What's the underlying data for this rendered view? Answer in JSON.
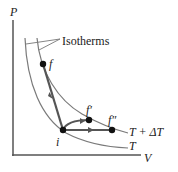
{
  "diagram": {
    "type": "PV diagram",
    "axes": {
      "y_label": "P",
      "x_label": "V"
    },
    "callout": "Isotherms",
    "isotherms": [
      {
        "label": "T + ΔT",
        "color": "#7a7a7a"
      },
      {
        "label": "T",
        "color": "#7a7a7a"
      }
    ],
    "points": [
      {
        "id": "i",
        "label": "i"
      },
      {
        "id": "f",
        "label": "f"
      },
      {
        "id": "f1",
        "label": "f′"
      },
      {
        "id": "f2",
        "label": "f″"
      }
    ],
    "paths": [
      {
        "from": "i",
        "to": "f"
      },
      {
        "from": "i",
        "to": "f′"
      },
      {
        "from": "i",
        "to": "f″"
      }
    ],
    "colors": {
      "axis": "#555555",
      "path": "#555555",
      "point": "#111111"
    }
  }
}
